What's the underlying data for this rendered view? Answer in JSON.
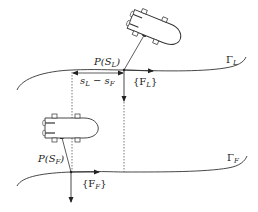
{
  "diagram": {
    "colors": {
      "stroke": "#333333",
      "dotted": "#555555",
      "background": "#ffffff"
    },
    "paths": {
      "leader": {
        "name": "Γ",
        "subscript": "L",
        "point_label": "P(S",
        "point_subscript": "L",
        "frame_label": "{F",
        "frame_subscript": "L",
        "frame_close": "}"
      },
      "follower": {
        "name": "Γ",
        "subscript": "F",
        "point_label": "P(S",
        "point_subscript": "F",
        "frame_label": "{F",
        "frame_subscript": "F",
        "frame_close": "}"
      }
    },
    "distance_label": {
      "s1": "s",
      "s1_sub": "L",
      "minus": " − ",
      "s2": "s",
      "s2_sub": "F"
    },
    "vessels": [
      {
        "name": "leader-vessel",
        "icon": "vessel-icon"
      },
      {
        "name": "follower-vessel",
        "icon": "vessel-icon"
      }
    ]
  }
}
